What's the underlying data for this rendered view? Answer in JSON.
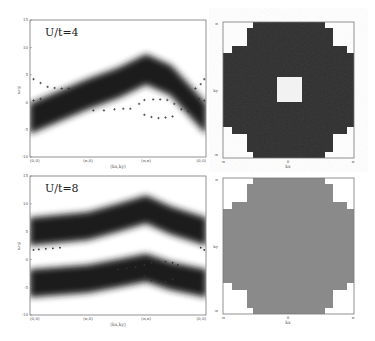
{
  "figure": {
    "panels": [
      {
        "id": "spectral-U4",
        "label": "U/t=4",
        "type": "spectral",
        "xlabel": "(kx,ky)",
        "ylabel": "ω-μ",
        "xticks": [
          "(0,0)",
          "(π,0)",
          "(π,π)",
          "(0,0)"
        ],
        "yticks": [
          "15",
          "10",
          "5",
          "0",
          "-5",
          "-10"
        ]
      },
      {
        "id": "map-U4",
        "type": "momentum-map",
        "xlabel": "kx",
        "ylabel": "ky",
        "xticks": [
          "-π",
          "0",
          "π"
        ],
        "yticks": [
          "π",
          "ky",
          "-π"
        ]
      },
      {
        "id": "spectral-U8",
        "label": "U/t=8",
        "type": "spectral",
        "xlabel": "(kx,ky)",
        "ylabel": "ω-μ",
        "xticks": [
          "(0,0)",
          "(π,0)",
          "(π,π)",
          "(0,0)"
        ],
        "yticks": [
          "15",
          "10",
          "5",
          "0",
          "-5",
          "-10"
        ]
      },
      {
        "id": "map-U8",
        "type": "momentum-map",
        "xlabel": "kx",
        "ylabel": "ky",
        "xticks": [
          "-π",
          "0",
          "π"
        ],
        "yticks": [
          "π",
          "ky",
          "-π"
        ]
      }
    ]
  },
  "chart_data": [
    {
      "type": "heatmap",
      "title": "U/t=4",
      "xlabel": "(kx,ky)",
      "ylabel": "ω-μ",
      "x_path": [
        "(0,0)",
        "(π,0)",
        "(π,π)",
        "(0,0)"
      ],
      "ylim": [
        -10,
        15
      ],
      "yticks": [
        15,
        10,
        5,
        0,
        -5,
        -10
      ],
      "bands": [
        {
          "name": "spectral weight band",
          "x": [
            0,
            0.33,
            0.5,
            0.66,
            0.8,
            1.0
          ],
          "center": [
            -3,
            1.5,
            3.5,
            6,
            4,
            -3
          ],
          "width": 5.5
        }
      ],
      "markers": {
        "symbol": "cross",
        "upper": {
          "x": [
            0.02,
            0.06,
            0.1,
            0.14,
            0.18,
            0.22,
            0.94,
            0.97,
            0.99
          ],
          "y": [
            4.2,
            3.5,
            2.8,
            2.6,
            2.5,
            2.5,
            2.5,
            3.3,
            4.2
          ]
        },
        "lower": {
          "x": [
            0.02,
            0.06,
            0.36,
            0.42,
            0.48,
            0.53,
            0.57,
            0.62,
            0.65,
            0.7,
            0.74,
            0.78,
            0.82,
            0.86,
            0.9,
            0.96,
            0.99
          ],
          "y": [
            0.3,
            0.6,
            -1.5,
            -1.5,
            -1.3,
            -1.2,
            -1.2,
            -0.3,
            0.4,
            0.5,
            0.5,
            0.4,
            -0.3,
            -1.3,
            -1.7,
            0.6,
            0.3
          ]
        },
        "loop_low": {
          "x": [
            0.65,
            0.69,
            0.73,
            0.77,
            0.81
          ],
          "y": [
            -2.3,
            -2.7,
            -2.9,
            -2.8,
            -2.6
          ]
        }
      }
    },
    {
      "type": "heatmap",
      "title": "",
      "xlabel": "kx",
      "ylabel": "ky",
      "xticks": [
        "-π",
        "0",
        "π"
      ],
      "fill": "dark",
      "fill_color": "#2e2e2e",
      "shape": "staircase disk with white corners",
      "center_hole": true,
      "hole_color": "#f2f2f2"
    },
    {
      "type": "heatmap",
      "title": "U/t=8",
      "xlabel": "(kx,ky)",
      "ylabel": "ω-μ",
      "x_path": [
        "(0,0)",
        "(π,0)",
        "(π,π)",
        "(0,0)"
      ],
      "ylim": [
        -10,
        15
      ],
      "yticks": [
        15,
        10,
        5,
        0,
        -5,
        -10
      ],
      "bands": [
        {
          "name": "upper Hubbard band",
          "x": [
            0,
            0.33,
            0.5,
            0.66,
            0.8,
            1.0
          ],
          "center": [
            5,
            6,
            7.5,
            9,
            7,
            5
          ],
          "width": 5
        },
        {
          "name": "lower Hubbard band",
          "x": [
            0,
            0.33,
            0.5,
            0.66,
            0.8,
            1.0
          ],
          "center": [
            -4.3,
            -3.5,
            -2.5,
            -1.5,
            -3,
            -4.3
          ],
          "width": 5
        }
      ],
      "markers": {
        "symbol": "dot",
        "upper": {
          "x": [
            0.02,
            0.05,
            0.09,
            0.13,
            0.17,
            0.97,
            0.99
          ],
          "y": [
            1.7,
            1.8,
            1.9,
            2.0,
            2.1,
            2.1,
            1.7
          ]
        },
        "lower": {
          "x": [
            0.5,
            0.55,
            0.6,
            0.65,
            0.69,
            0.73,
            0.77,
            0.81,
            0.84,
            0.87
          ],
          "y": [
            -1.8,
            -1.6,
            -1.4,
            -1.0,
            -0.6,
            -0.4,
            -0.4,
            -0.6,
            -1.0,
            -1.7
          ]
        },
        "loop_low": {
          "x": [
            0.65,
            0.69,
            0.73,
            0.77,
            0.81
          ],
          "y": [
            -3.0,
            -3.8,
            -4.1,
            -4.0,
            -3.6
          ]
        }
      }
    },
    {
      "type": "heatmap",
      "title": "",
      "xlabel": "kx",
      "ylabel": "ky",
      "xticks": [
        "-π",
        "0",
        "π"
      ],
      "fill": "medium gray",
      "fill_color": "#8a8a8a",
      "shape": "staircase disk with white corners",
      "center_hole": false
    }
  ],
  "colors": {
    "background": "#ffffff",
    "ink": "#1e1e1e",
    "dark_fill": "#2e2e2e",
    "gray_fill": "#8a8a8a",
    "frame": "#777777"
  }
}
